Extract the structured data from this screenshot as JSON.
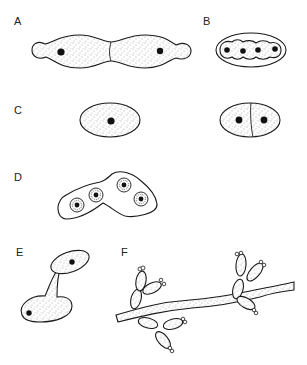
{
  "figure": {
    "colors": {
      "outline": "#1a1a1a",
      "nucleus": "#111111",
      "stipple": "#555555",
      "background": "#ffffff"
    },
    "panels": [
      {
        "id": "A",
        "label": "A",
        "content": "Budding / elongated dividing cell with two nuclei and septum"
      },
      {
        "id": "B",
        "label": "B",
        "content": "Ascus-like envelope containing four spores with nuclei"
      },
      {
        "id": "C",
        "label": "C",
        "content": "Single cell with one nucleus (left) and cell divided by fission into two (right)"
      },
      {
        "id": "D",
        "label": "D",
        "content": "Bent ascus containing four ascospores"
      },
      {
        "id": "E",
        "label": "E",
        "content": "Cell producing a bud on a stalk/conjugation tube"
      },
      {
        "id": "F",
        "label": "F",
        "content": "Hypha with clusters of blastoconidia"
      }
    ]
  }
}
